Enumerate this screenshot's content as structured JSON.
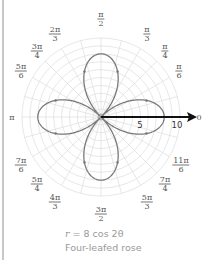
{
  "chart_data": {
    "type": "polar-line",
    "title": "",
    "equation": "r = 8 cos 2θ",
    "caption": "Four-leafed rose",
    "rlim": [
      0,
      10
    ],
    "r_ticks": [
      5,
      10
    ],
    "grid": {
      "circles_every": 1,
      "radial_every_deg": 15
    },
    "angle_labels": [
      {
        "angle": "0",
        "num": "0",
        "den": ""
      },
      {
        "angle": "π/6",
        "num": "π",
        "den": "6"
      },
      {
        "angle": "π/4",
        "num": "π",
        "den": "4"
      },
      {
        "angle": "π/3",
        "num": "π",
        "den": "3"
      },
      {
        "angle": "π/2",
        "num": "π",
        "den": "2"
      },
      {
        "angle": "2π/3",
        "num": "2π",
        "den": "3"
      },
      {
        "angle": "3π/4",
        "num": "3π",
        "den": "4"
      },
      {
        "angle": "5π/6",
        "num": "5π",
        "den": "6"
      },
      {
        "angle": "π",
        "num": "π",
        "den": ""
      },
      {
        "angle": "7π/6",
        "num": "7π",
        "den": "6"
      },
      {
        "angle": "5π/4",
        "num": "5π",
        "den": "4"
      },
      {
        "angle": "4π/3",
        "num": "4π",
        "den": "3"
      },
      {
        "angle": "3π/2",
        "num": "3π",
        "den": "2"
      },
      {
        "angle": "5π/3",
        "num": "5π",
        "den": "3"
      },
      {
        "angle": "7π/4",
        "num": "7π",
        "den": "4"
      },
      {
        "angle": "11π/6",
        "num": "11π",
        "den": "6"
      }
    ],
    "series": [
      {
        "name": "r = 8 cos 2θ",
        "amplitude": 8,
        "k": 2,
        "petals": 4,
        "petal_tips_deg": [
          0,
          90,
          180,
          270
        ]
      }
    ]
  },
  "labels": {
    "a0": "0",
    "pi": "π",
    "pi6": {
      "num": "π",
      "den": "6"
    },
    "pi4": {
      "num": "π",
      "den": "4"
    },
    "pi3": {
      "num": "π",
      "den": "3"
    },
    "pi2": {
      "num": "π",
      "den": "2"
    },
    "p2pi3": {
      "num": "2π",
      "den": "3"
    },
    "p3pi4": {
      "num": "3π",
      "den": "4"
    },
    "p5pi6": {
      "num": "5π",
      "den": "6"
    },
    "p7pi6": {
      "num": "7π",
      "den": "6"
    },
    "p5pi4": {
      "num": "5π",
      "den": "4"
    },
    "p4pi3": {
      "num": "4π",
      "den": "3"
    },
    "p3pi2": {
      "num": "3π",
      "den": "2"
    },
    "p5pi3": {
      "num": "5π",
      "den": "3"
    },
    "p7pi4": {
      "num": "7π",
      "den": "4"
    },
    "p11pi6": {
      "num": "11π",
      "den": "6"
    },
    "tick5": "5",
    "tick10": "10"
  },
  "caption": {
    "eq_var": "r",
    "eq_rest": " = 8 cos 2θ",
    "name": "Four-leafed rose"
  }
}
